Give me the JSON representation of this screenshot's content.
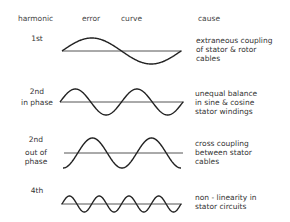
{
  "headers": {
    "harmonic": "harmonic",
    "error": "error",
    "curve": "curve",
    "cause": "cause"
  },
  "rows": [
    {
      "harmonic_lines": [
        "1st"
      ],
      "cycles": 1,
      "phase": "sine",
      "cause_lines": [
        "extraneous coupling",
        "of stator & rotor",
        "cables"
      ]
    },
    {
      "harmonic_lines": [
        "2nd",
        "in phase"
      ],
      "cycles": 2,
      "phase": "sine",
      "cause_lines": [
        "unequal balance",
        "in sine & cosine",
        "stator windings"
      ]
    },
    {
      "harmonic_lines": [
        "2nd",
        "out of",
        "phase"
      ],
      "cycles": 2,
      "phase": "negative-cosine",
      "cause_lines": [
        "cross coupling",
        "between stator",
        "cables"
      ]
    },
    {
      "harmonic_lines": [
        "4th"
      ],
      "cycles": 4,
      "phase": "sine",
      "cause_lines": [
        "non - linearity in",
        "stator circuits"
      ]
    }
  ]
}
